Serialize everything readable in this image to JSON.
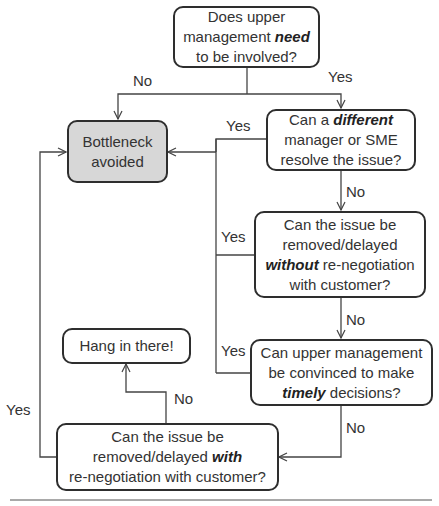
{
  "nodes": {
    "q1": {
      "lines": [
        "Does upper",
        "management ",
        "to be involved?"
      ],
      "emph": "need"
    },
    "bottleneck": {
      "lines": [
        "Bottleneck",
        "avoided"
      ]
    },
    "q2": {
      "pre": "Can a ",
      "emph": "different",
      "lines": [
        "manager or SME",
        "resolve the issue?"
      ]
    },
    "q3": {
      "lines": [
        "Can the issue be",
        "removed/delayed",
        " re-negotiation",
        "with customer?"
      ],
      "emph": "without"
    },
    "q4": {
      "lines": [
        "Can upper management",
        "be convinced to make",
        " decisions?"
      ],
      "emph": "timely"
    },
    "q5": {
      "lines": [
        "Can the issue be",
        "removed/delayed ",
        "re-negotiation with customer?"
      ],
      "emph": "with"
    },
    "hang": {
      "lines": [
        "Hang in there!"
      ]
    }
  },
  "labels": {
    "q1_no": "No",
    "q1_yes": "Yes",
    "q2_yes": "Yes",
    "q2_no": "No",
    "q3_yes": "Yes",
    "q3_no": "No",
    "q4_yes": "Yes",
    "q4_no": "No",
    "q5_no": "No",
    "q5_yes": "Yes"
  },
  "colors": {
    "line": "#444444",
    "terminal_fill": "#d7d7d7",
    "border": "#2e2e2e"
  }
}
